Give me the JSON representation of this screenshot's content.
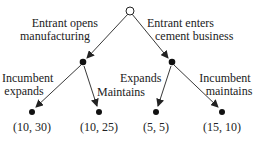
{
  "tree": {
    "root": {
      "type": "decision",
      "player": "Entrant"
    },
    "branches": {
      "left": {
        "label_line1": "Entrant opens",
        "label_line2": "manufacturing"
      },
      "right": {
        "label_line1": "Entrant enters",
        "label_line2": "cement business"
      }
    },
    "left_node": {
      "left_branch": {
        "label_line1": "Incumbent",
        "label_line2": "expands"
      },
      "right_branch": {
        "label": "Maintains"
      }
    },
    "right_node": {
      "left_branch": {
        "label": "Expands"
      },
      "right_branch": {
        "label_line1": "Incumbent",
        "label_line2": "maintains"
      }
    },
    "payoffs": [
      "(10, 30)",
      "(10, 25)",
      "(5, 5)",
      "(15, 10)"
    ]
  }
}
